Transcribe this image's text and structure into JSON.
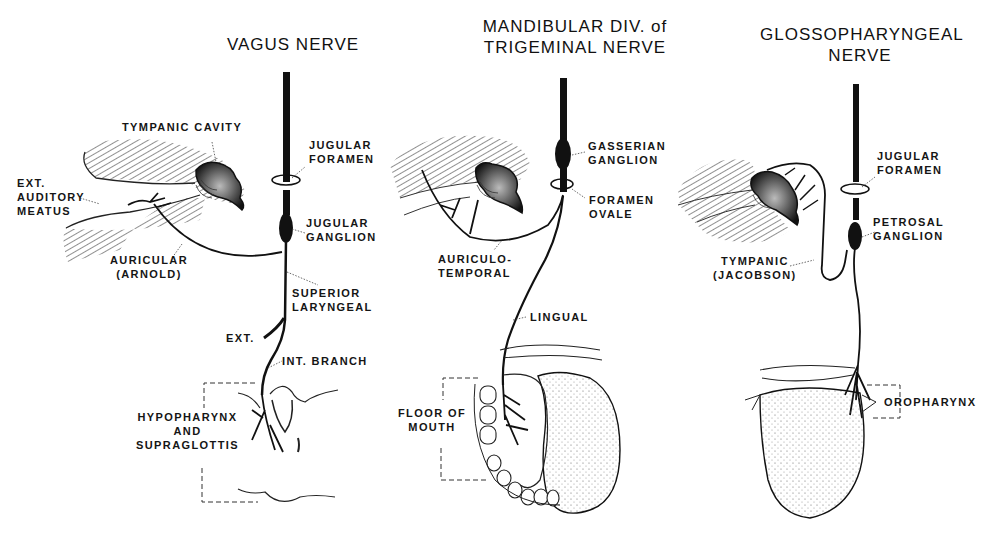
{
  "figure": {
    "panels": [
      {
        "id": "vagus",
        "title_lines": [
          "VAGUS NERVE"
        ],
        "labels": {
          "tympanic_cavity": "TYMPANIC CAVITY",
          "ext_auditory_meatus": [
            "EXT.",
            "AUDITORY",
            "MEATUS"
          ],
          "jugular_foramen": [
            "JUGULAR",
            "FORAMEN"
          ],
          "jugular_ganglion": [
            "JUGULAR",
            "GANGLION"
          ],
          "auricular": [
            "AURICULAR",
            "(ARNOLD)"
          ],
          "superior_laryngeal": [
            "SUPERIOR",
            "LARYNGEAL"
          ],
          "ext": "EXT.",
          "int_branch": "INT. BRANCH",
          "region": [
            "HYPOPHARYNX",
            "AND",
            "SUPRAGLOTTIS"
          ]
        }
      },
      {
        "id": "trigeminal",
        "title_lines": [
          "MANDIBULAR DIV. of",
          "TRIGEMINAL NERVE"
        ],
        "labels": {
          "gasserian_ganglion": [
            "GASSERIAN",
            "GANGLION"
          ],
          "foramen_ovale": [
            "FORAMEN",
            "OVALE"
          ],
          "auriculotemporal": [
            "AURICULO-",
            "TEMPORAL"
          ],
          "lingual": "LINGUAL",
          "region": [
            "FLOOR OF",
            "MOUTH"
          ]
        }
      },
      {
        "id": "glossopharyngeal",
        "title_lines": [
          "GLOSSOPHARYNGEAL",
          "NERVE"
        ],
        "labels": {
          "jugular_foramen": [
            "JUGULAR",
            "FORAMEN"
          ],
          "petrosal_ganglion": [
            "PETROSAL",
            "GANGLION"
          ],
          "tympanic": [
            "TYMPANIC",
            "(JACOBSON)"
          ],
          "region": "OROPHARYNX"
        }
      }
    ],
    "colors": {
      "ink": "#111111",
      "paper": "#ffffff"
    }
  }
}
